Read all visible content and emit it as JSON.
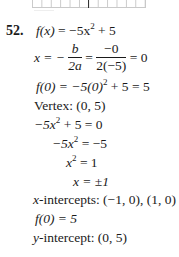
{
  "problem": {
    "number": "52.",
    "function_def": {
      "lhs": "f(x)",
      "eq": " = −5x",
      "exp": "2",
      "rest": " + 5"
    },
    "vertex_x": {
      "lhs": "x = −",
      "frac1_num": "b",
      "frac1_den": "2a",
      "eq1": " = ",
      "frac2_num": "−0",
      "frac2_den": "2(−5)",
      "result": " = 0"
    },
    "vertex_y": {
      "text": "f(0) = −5(0)",
      "exp": "2",
      "rest": " + 5 = 5"
    },
    "vertex": {
      "label": "Vertex: ",
      "value": "(0, 5)"
    },
    "solve_steps": [
      {
        "pre": "−5x",
        "exp": "2",
        "post": " + 5 = 0"
      },
      {
        "pre": "−5x",
        "exp": "2",
        "post": " = −5"
      },
      {
        "pre": "x",
        "exp": "2",
        "post": " = 1"
      },
      {
        "pre": "x = ±1",
        "exp": "",
        "post": ""
      }
    ],
    "x_intercepts": {
      "label": "x",
      "label_rest": "-intercepts: ",
      "value": "(−1, 0), (1, 0)"
    },
    "f_zero": "f(0) = 5",
    "y_intercept": {
      "label": "y",
      "label_rest": "-intercept: ",
      "value": "(0, 5)"
    }
  },
  "graph_fragment": {
    "visible": true,
    "grid_color": "#c9c9c9",
    "axis_color": "#333333"
  }
}
